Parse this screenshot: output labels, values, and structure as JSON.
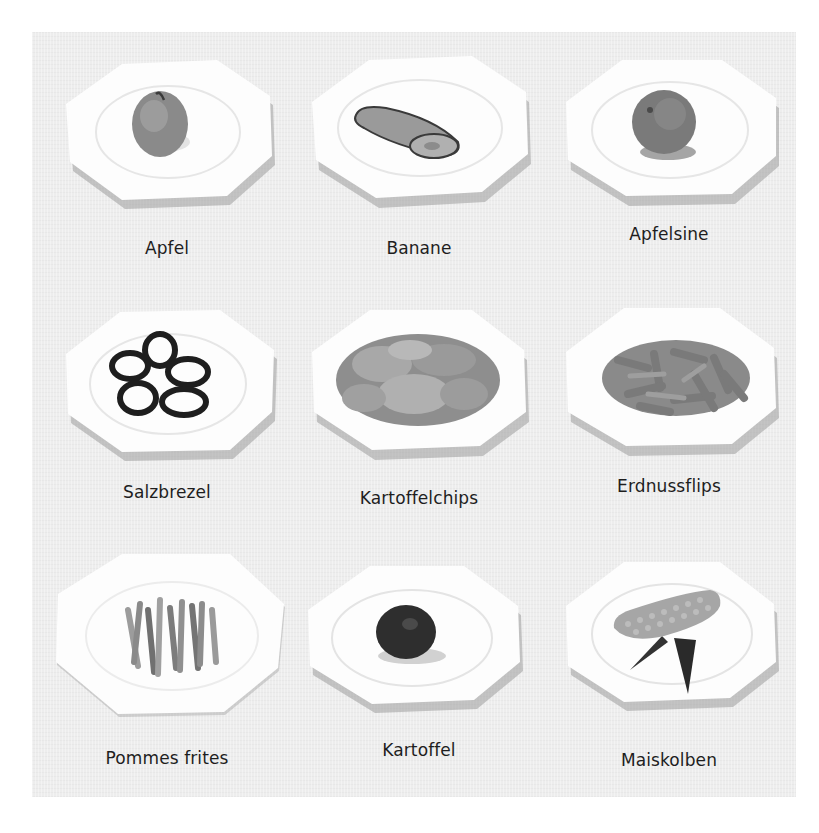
{
  "colors": {
    "background": "#ffffff",
    "panel": "#ededed",
    "plate": "#fdfdfd",
    "plate_shadow": "#9a9a9a",
    "label_text": "#1e1e1e"
  },
  "grid": {
    "rows": 3,
    "columns": 3,
    "items": [
      {
        "label": "Apfel",
        "food": "apple-icon"
      },
      {
        "label": "Banane",
        "food": "banana-icon"
      },
      {
        "label": "Apfelsine",
        "food": "orange-icon"
      },
      {
        "label": "Salzbrezel",
        "food": "pretzel-icon"
      },
      {
        "label": "Kartoffelchips",
        "food": "potato-chips-icon"
      },
      {
        "label": "Erdnussflips",
        "food": "peanut-flips-icon"
      },
      {
        "label": "Pommes frites",
        "food": "french-fries-icon"
      },
      {
        "label": "Kartoffel",
        "food": "potato-icon"
      },
      {
        "label": "Maiskolben",
        "food": "corn-cob-icon"
      }
    ]
  }
}
